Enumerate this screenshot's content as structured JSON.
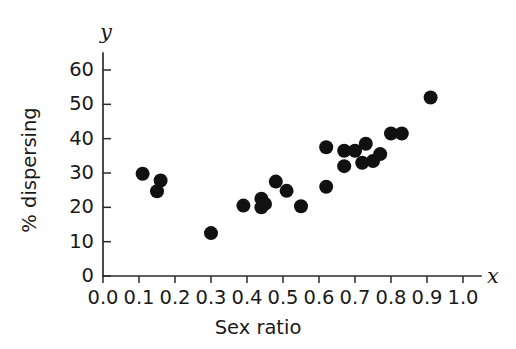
{
  "chart_data": {
    "type": "scatter",
    "title": "",
    "subtitle": "",
    "xlabel": "Sex ratio",
    "ylabel": "% dispersing",
    "x_variable_symbol": "x",
    "y_variable_symbol": "y",
    "xlim": [
      0.0,
      1.0
    ],
    "ylim": [
      0,
      65
    ],
    "grid": false,
    "legend": null,
    "xticks": [
      0.0,
      0.1,
      0.2,
      0.3,
      0.4,
      0.5,
      0.6,
      0.7,
      0.8,
      0.9,
      1.0
    ],
    "xtick_labels": [
      "0.0",
      "0.1",
      "0.2",
      "0.3",
      "0.4",
      "0.5",
      "0.6",
      "0.7",
      "0.8",
      "0.9",
      "1.0"
    ],
    "yticks": [
      0,
      10,
      20,
      30,
      40,
      50,
      60
    ],
    "ytick_labels": [
      "0",
      "10",
      "20",
      "30",
      "40",
      "50",
      "60"
    ],
    "marker": "filled-circle",
    "marker_color": "#111111",
    "marker_size": 7,
    "points": [
      {
        "x": 0.11,
        "y": 29.8
      },
      {
        "x": 0.15,
        "y": 24.7
      },
      {
        "x": 0.16,
        "y": 27.8
      },
      {
        "x": 0.3,
        "y": 12.5
      },
      {
        "x": 0.39,
        "y": 20.5
      },
      {
        "x": 0.44,
        "y": 22.5
      },
      {
        "x": 0.45,
        "y": 21.0
      },
      {
        "x": 0.44,
        "y": 20.0
      },
      {
        "x": 0.48,
        "y": 27.5
      },
      {
        "x": 0.51,
        "y": 24.8
      },
      {
        "x": 0.55,
        "y": 20.3
      },
      {
        "x": 0.62,
        "y": 37.5
      },
      {
        "x": 0.62,
        "y": 26.0
      },
      {
        "x": 0.67,
        "y": 36.5
      },
      {
        "x": 0.67,
        "y": 32.0
      },
      {
        "x": 0.7,
        "y": 36.5
      },
      {
        "x": 0.72,
        "y": 33.0
      },
      {
        "x": 0.73,
        "y": 38.5
      },
      {
        "x": 0.75,
        "y": 33.5
      },
      {
        "x": 0.77,
        "y": 35.5
      },
      {
        "x": 0.8,
        "y": 41.5
      },
      {
        "x": 0.83,
        "y": 41.5
      },
      {
        "x": 0.91,
        "y": 52.0
      }
    ]
  },
  "axis_style": {
    "axis_color": "#2b2b2b",
    "background_color": "#ffffff"
  }
}
